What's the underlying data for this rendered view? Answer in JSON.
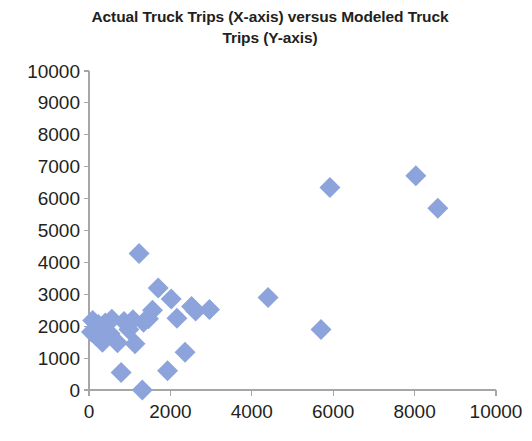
{
  "chart_data": {
    "type": "scatter",
    "title": "Actual Truck Trips (X-axis) versus Modeled Truck Trips (Y-axis)",
    "title_line1": "Actual Truck Trips (X-axis) versus Modeled Truck",
    "title_line2": "Trips (Y-axis)",
    "xlabel": "",
    "ylabel": "",
    "xlim": [
      0,
      10000
    ],
    "ylim": [
      0,
      10000
    ],
    "xticks": [
      0,
      2000,
      4000,
      6000,
      8000,
      10000
    ],
    "yticks": [
      0,
      1000,
      2000,
      3000,
      4000,
      5000,
      6000,
      7000,
      8000,
      9000,
      10000
    ],
    "xtick_labels": [
      "0",
      "2000",
      "4000",
      "6000",
      "8000",
      "10000"
    ],
    "ytick_labels": [
      "0",
      "1000",
      "2000",
      "3000",
      "4000",
      "5000",
      "6000",
      "7000",
      "8000",
      "9000",
      "10000"
    ],
    "grid": false,
    "legend": false,
    "marker": "diamond",
    "marker_color": "#8ca3dc",
    "series": [
      {
        "name": "Truck Trips",
        "points": [
          [
            60,
            1820
          ],
          [
            90,
            2180
          ],
          [
            170,
            1700
          ],
          [
            230,
            2050
          ],
          [
            330,
            1500
          ],
          [
            400,
            2100
          ],
          [
            520,
            1760
          ],
          [
            560,
            2220
          ],
          [
            700,
            1480
          ],
          [
            790,
            550
          ],
          [
            860,
            2150
          ],
          [
            980,
            1900
          ],
          [
            1080,
            2200
          ],
          [
            1130,
            1450
          ],
          [
            1230,
            4280
          ],
          [
            1310,
            0
          ],
          [
            1340,
            2120
          ],
          [
            1460,
            2230
          ],
          [
            1560,
            2500
          ],
          [
            1700,
            3200
          ],
          [
            1930,
            600
          ],
          [
            2020,
            2850
          ],
          [
            2160,
            2250
          ],
          [
            2360,
            1180
          ],
          [
            2520,
            2620
          ],
          [
            2620,
            2480
          ],
          [
            2960,
            2520
          ],
          [
            4400,
            2900
          ],
          [
            5700,
            1900
          ],
          [
            5920,
            6350
          ],
          [
            8030,
            6720
          ],
          [
            8570,
            5700
          ]
        ]
      }
    ]
  },
  "axes": {
    "y_axis_name": "y-axis",
    "x_axis_name": "x-axis"
  }
}
